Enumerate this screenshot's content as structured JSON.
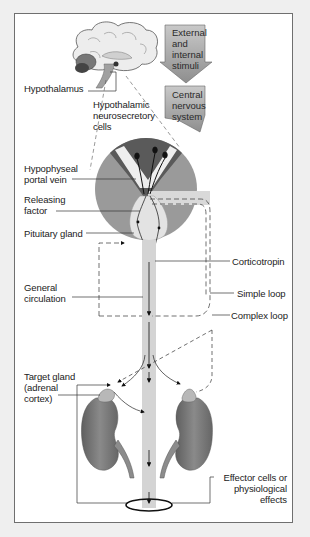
{
  "diagram": {
    "type": "physiology-feedback-loop",
    "colors": {
      "page_background": "#efefef",
      "frame_background": "#ffffff",
      "frame_border": "#6f6f6f",
      "circle_outer": "#9a9a9a",
      "circle_top_dark": "#5a5a5a",
      "pituitary": "#d8d8d8",
      "circulation_band": "#d4d4d4",
      "kidney": "#7a7a7a",
      "adrenal_cap": "#b5b5b5",
      "stimulus_arrow": "#a8a8a8"
    },
    "stimulus_arrows": [
      {
        "id": "external-internal-stimuli",
        "text": "External\nand\ninternal\nstimuli"
      },
      {
        "id": "central-nervous-system",
        "text": "Central\nnervous\nsystem"
      }
    ],
    "labels": {
      "hypothalamus": "Hypothalamus",
      "hypothalamic_neurosecretory_cells": "Hypothalamic\nneurosecretory\ncells",
      "hypophyseal_portal_vein": "Hypophyseal\nportal vein",
      "releasing_factor": "Releasing\nfactor",
      "pituitary_gland": "Pituitary gland",
      "corticotropin": "Corticotropin",
      "general_circulation": "General\ncirculation",
      "simple_loop": "Simple loop",
      "complex_loop": "Complex loop",
      "target_gland": "Target gland\n(adrenal\ncortex)",
      "effector_cells": "Effector cells or\nphysiological\neffects"
    },
    "nodes": [
      "Hypothalamus",
      "Hypothalamic neurosecretory cells",
      "Hypophyseal portal vein",
      "Releasing factor",
      "Pituitary gland",
      "Corticotropin",
      "General circulation",
      "Target gland (adrenal cortex)",
      "Effector cells or physiological effects"
    ],
    "loops": [
      "Simple loop",
      "Complex loop"
    ]
  }
}
